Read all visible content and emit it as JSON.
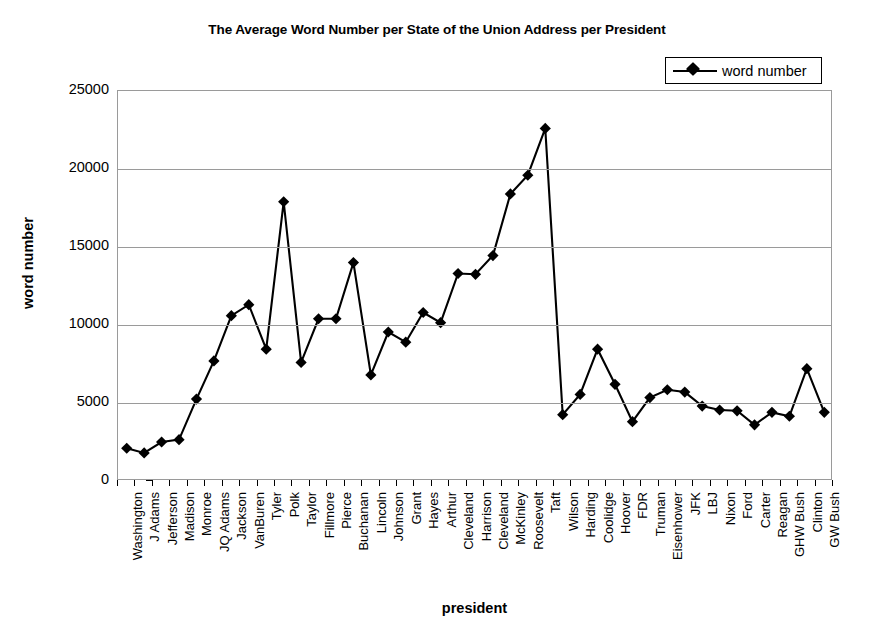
{
  "chart_data": {
    "type": "line",
    "title": "The Average Word Number per State of the Union Address per President",
    "xlabel": "president",
    "ylabel": "word number",
    "ylim": [
      0,
      25000
    ],
    "ytick_step": 5000,
    "yticks": [
      0,
      5000,
      10000,
      15000,
      20000,
      25000
    ],
    "ytick_labels": [
      "0",
      "5000",
      "10000",
      "15000",
      "20000",
      "25000"
    ],
    "grid": true,
    "legend_position": "top-right",
    "legend": [
      "word number"
    ],
    "marker": "diamond",
    "line_color": "#000000",
    "marker_color": "#000000",
    "categories": [
      "Washington",
      "J Adams",
      "Jefferson",
      "Madison",
      "Monroe",
      "JQ Adams",
      "Jackson",
      "VanBuren",
      "Tyler",
      "Polk",
      "Taylor",
      "Fillmore",
      "Pierce",
      "Buchanan",
      "Lincoln",
      "Johnson",
      "Grant",
      "Hayes",
      "Arthur",
      "Cleveland",
      "Harrison",
      "Cleveland",
      "McKinley",
      "Roosevelt",
      "Taft",
      "Wilson",
      "Harding",
      "Coolidge",
      "Hoover",
      "FDR",
      "Truman",
      "Eisenhower",
      "JFK",
      "LBJ",
      "Nixon",
      "Ford",
      "Carter",
      "Reagan",
      "GHW Bush",
      "Clinton",
      "GW Bush"
    ],
    "series": [
      {
        "name": "word number",
        "values": [
          2100,
          1800,
          2500,
          2650,
          5250,
          7700,
          10600,
          11300,
          8450,
          17900,
          7600,
          10400,
          10400,
          14000,
          6800,
          9550,
          8900,
          10800,
          10150,
          13300,
          13250,
          14450,
          18400,
          19600,
          22600,
          4250,
          5550,
          8450,
          6200,
          3800,
          5350,
          5850,
          5700,
          4800,
          4550,
          4500,
          3600,
          4400,
          4150,
          7200,
          4400
        ]
      }
    ]
  }
}
